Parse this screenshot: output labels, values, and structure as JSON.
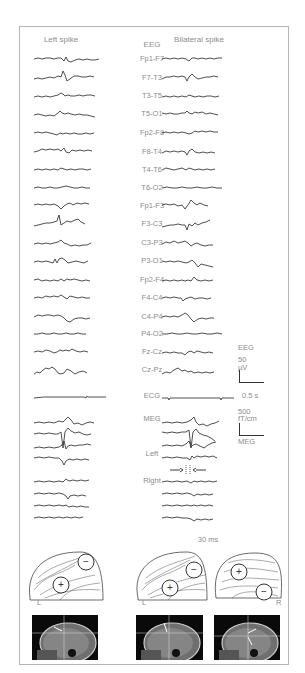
{
  "figure": {
    "column_left_title": "Left spike",
    "column_right_title": "Bilateral spike",
    "eeg_header": "EEG",
    "eeg_channels": [
      "Fp1-F7",
      "F7-T3",
      "T3-T5",
      "T5-O1",
      "Fp2-F8",
      "F8-T4",
      "T4-T6",
      "T6-O2",
      "Fp1-F3",
      "F3-C3",
      "C3-P3",
      "P3-O1",
      "Fp2-F4",
      "F4-C4",
      "C4-P4",
      "P4-O2",
      "Fz-Cz",
      "Cz-Pz"
    ],
    "ecg_label": "ECG",
    "meg_header": "MEG",
    "meg_left_label": "Left",
    "meg_right_label": "Right",
    "time_marker_label": "30 ms",
    "scale": {
      "eeg_label": "EEG",
      "eeg_amp": "50",
      "eeg_unit": "µV",
      "time": "0.5 s",
      "meg_amp": "500",
      "meg_unit": "fT/cm",
      "meg_label": "MEG"
    },
    "topomaps": [
      {
        "side_label": "L",
        "poles": [
          "−",
          "+"
        ]
      },
      {
        "side_label": "L",
        "poles": [
          "−",
          "+"
        ]
      },
      {
        "side_label": "R",
        "poles": [
          "+",
          "−"
        ]
      }
    ],
    "colors": {
      "frame": "#b5b5b5",
      "trace": "#3a3a3a",
      "label": "#8c8c8c",
      "mri_bg": "#0a0a0a"
    }
  }
}
